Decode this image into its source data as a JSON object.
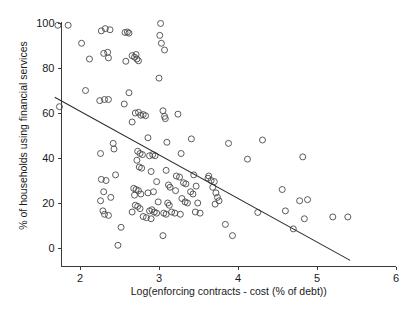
{
  "chart_data": {
    "type": "scatter",
    "title": "",
    "xlabel": "Log(enforcing contracts - cost (% of debt))",
    "ylabel": "% of households using financial services",
    "xlim": [
      1.68,
      6.0
    ],
    "ylim": [
      -6.0,
      101.0
    ],
    "xticks": [
      2,
      3,
      4,
      5,
      6
    ],
    "xtick_labels": [
      "2",
      "3",
      "4",
      "5",
      "6"
    ],
    "yticks": [
      0,
      20,
      40,
      60,
      80,
      100
    ],
    "ytick_labels": [
      "0",
      "20",
      "40",
      "60",
      "80",
      "100"
    ],
    "grid": false,
    "legend": null,
    "marker": "open-circle",
    "marker_color": "#4a4a4a",
    "line_color": "#2b2b2b",
    "series": [
      {
        "name": "countries",
        "points": [
          [
            1.72,
            99.0
          ],
          [
            1.85,
            99.0
          ],
          [
            1.74,
            62.8
          ],
          [
            2.02,
            91.0
          ],
          [
            2.12,
            84.0
          ],
          [
            2.07,
            70.0
          ],
          [
            2.27,
            96.5
          ],
          [
            2.32,
            97.5
          ],
          [
            2.38,
            97.0
          ],
          [
            2.3,
            86.5
          ],
          [
            2.35,
            87.0
          ],
          [
            2.36,
            84.5
          ],
          [
            2.31,
            66.0
          ],
          [
            2.36,
            66.0
          ],
          [
            2.25,
            65.5
          ],
          [
            2.26,
            42.0
          ],
          [
            2.42,
            46.5
          ],
          [
            2.43,
            44.0
          ],
          [
            2.27,
            30.5
          ],
          [
            2.33,
            30.0
          ],
          [
            2.45,
            32.5
          ],
          [
            2.3,
            25.0
          ],
          [
            2.39,
            22.5
          ],
          [
            2.26,
            21.0
          ],
          [
            2.29,
            16.5
          ],
          [
            2.31,
            15.0
          ],
          [
            2.36,
            14.5
          ],
          [
            2.48,
            1.2
          ],
          [
            2.52,
            9.2
          ],
          [
            2.57,
            95.8
          ],
          [
            2.6,
            96.0
          ],
          [
            2.62,
            95.5
          ],
          [
            2.58,
            83.0
          ],
          [
            2.66,
            85.5
          ],
          [
            2.69,
            84.8
          ],
          [
            2.72,
            84.0
          ],
          [
            2.74,
            83.2
          ],
          [
            2.71,
            86.0
          ],
          [
            2.56,
            64.0
          ],
          [
            2.62,
            69.0
          ],
          [
            2.66,
            56.0
          ],
          [
            2.7,
            60.0
          ],
          [
            2.74,
            60.3
          ],
          [
            2.77,
            59.0
          ],
          [
            2.8,
            59.3
          ],
          [
            2.83,
            58.8
          ],
          [
            2.73,
            43.0
          ],
          [
            2.76,
            42.0
          ],
          [
            2.79,
            41.5
          ],
          [
            2.72,
            39.0
          ],
          [
            2.75,
            36.0
          ],
          [
            2.78,
            35.5
          ],
          [
            2.68,
            26.5
          ],
          [
            2.71,
            26.0
          ],
          [
            2.74,
            25.5
          ],
          [
            2.69,
            23.5
          ],
          [
            2.77,
            24.0
          ],
          [
            2.7,
            19.0
          ],
          [
            2.73,
            18.5
          ],
          [
            2.76,
            17.5
          ],
          [
            2.66,
            16.0
          ],
          [
            2.8,
            14.0
          ],
          [
            2.84,
            13.5
          ],
          [
            2.86,
            49.0
          ],
          [
            2.88,
            41.0
          ],
          [
            2.92,
            41.5
          ],
          [
            2.95,
            41.0
          ],
          [
            2.9,
            34.0
          ],
          [
            2.97,
            29.5
          ],
          [
            2.86,
            24.5
          ],
          [
            2.93,
            25.0
          ],
          [
            2.88,
            16.5
          ],
          [
            2.91,
            17.0
          ],
          [
            2.94,
            16.0
          ],
          [
            2.97,
            15.5
          ],
          [
            2.9,
            13.0
          ],
          [
            2.99,
            20.5
          ],
          [
            3.02,
            99.8
          ],
          [
            3.01,
            94.5
          ],
          [
            3.03,
            91.0
          ],
          [
            3.07,
            88.0
          ],
          [
            3.0,
            75.5
          ],
          [
            3.05,
            61.0
          ],
          [
            3.07,
            58.5
          ],
          [
            3.08,
            57.5
          ],
          [
            3.1,
            47.0
          ],
          [
            3.09,
            34.5
          ],
          [
            3.12,
            28.0
          ],
          [
            3.14,
            27.0
          ],
          [
            3.11,
            20.0
          ],
          [
            3.13,
            19.0
          ],
          [
            3.06,
            15.5
          ],
          [
            3.09,
            15.0
          ],
          [
            3.16,
            16.0
          ],
          [
            3.05,
            5.5
          ],
          [
            3.24,
            59.5
          ],
          [
            3.28,
            42.0
          ],
          [
            3.22,
            32.0
          ],
          [
            3.26,
            31.5
          ],
          [
            3.31,
            29.0
          ],
          [
            3.34,
            28.5
          ],
          [
            3.21,
            25.5
          ],
          [
            3.29,
            22.0
          ],
          [
            3.33,
            20.5
          ],
          [
            3.2,
            15.5
          ],
          [
            3.27,
            15.0
          ],
          [
            3.36,
            20.0
          ],
          [
            3.41,
            48.5
          ],
          [
            3.44,
            32.5
          ],
          [
            3.47,
            27.5
          ],
          [
            3.4,
            25.0
          ],
          [
            3.43,
            24.0
          ],
          [
            3.49,
            20.0
          ],
          [
            3.46,
            16.0
          ],
          [
            3.52,
            15.5
          ],
          [
            3.62,
            31.0
          ],
          [
            3.66,
            30.0
          ],
          [
            3.7,
            29.5
          ],
          [
            3.63,
            32.0
          ],
          [
            3.68,
            27.0
          ],
          [
            3.72,
            24.5
          ],
          [
            3.74,
            22.5
          ],
          [
            3.76,
            21.0
          ],
          [
            3.71,
            19.5
          ],
          [
            3.88,
            46.5
          ],
          [
            3.84,
            10.5
          ],
          [
            3.93,
            5.5
          ],
          [
            4.12,
            39.5
          ],
          [
            4.25,
            15.8
          ],
          [
            4.31,
            48.0
          ],
          [
            4.56,
            26.0
          ],
          [
            4.6,
            16.5
          ],
          [
            4.7,
            8.5
          ],
          [
            4.78,
            21.0
          ],
          [
            4.82,
            40.5
          ],
          [
            4.88,
            21.5
          ],
          [
            4.84,
            13.0
          ],
          [
            5.2,
            13.8
          ],
          [
            5.39,
            13.8
          ]
        ]
      }
    ],
    "trendline": {
      "name": "linear fit",
      "x_start": 1.68,
      "y_start": 67.0,
      "x_end": 5.42,
      "y_end": -5.5
    }
  }
}
